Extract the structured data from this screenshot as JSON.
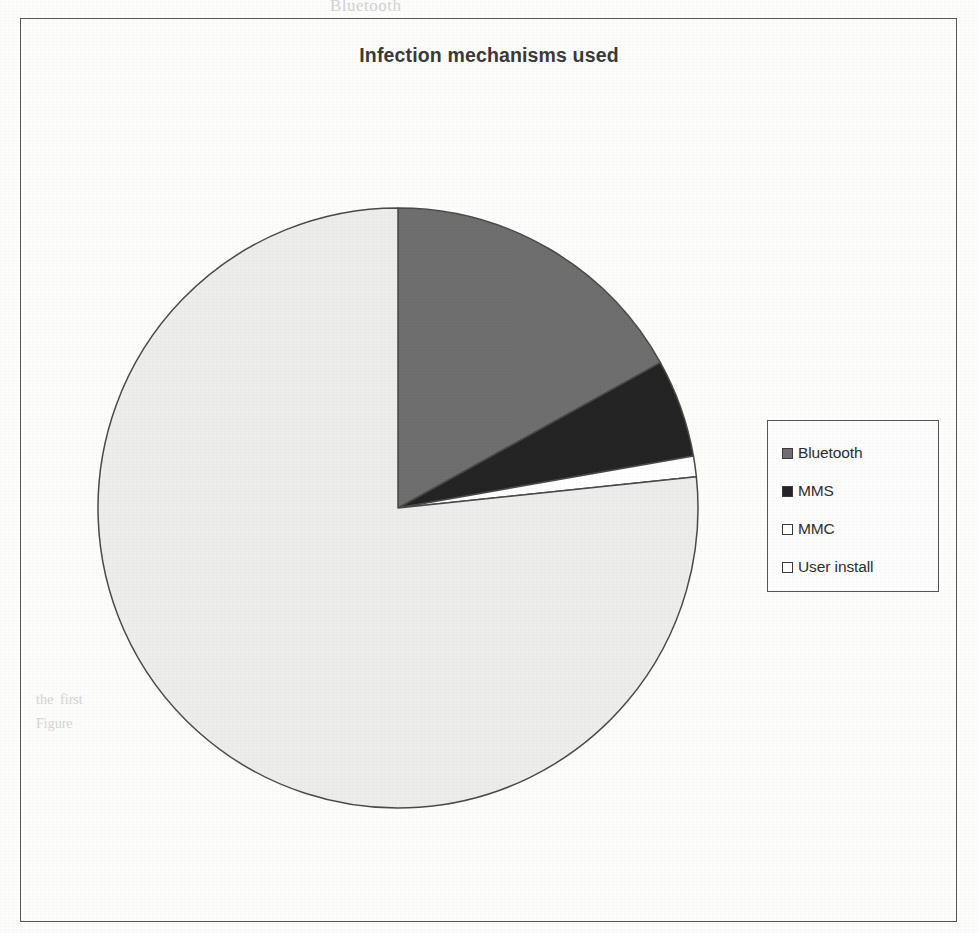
{
  "chart_data": {
    "type": "pie",
    "title": "Infection mechanisms used",
    "subtitle": "",
    "xlabel": "",
    "ylabel": "",
    "grid": false,
    "legend_position": "right",
    "start_angle_deg": 0,
    "direction": "clockwise",
    "categories": [
      "Bluetooth",
      "MMS",
      "MMC",
      "User install"
    ],
    "values": [
      17,
      5.3,
      1.1,
      76.6
    ],
    "value_unit": "percent",
    "angles_deg": [
      61,
      19,
      4,
      276
    ],
    "slice_colors": [
      "#6f6f6f",
      "#242424",
      "#ffffff",
      "#ededeb"
    ],
    "slices": [
      {
        "label": "Bluetooth",
        "value": 17,
        "angle_deg": 61,
        "color": "#6f6f6f",
        "swatch": "#6f6f6f"
      },
      {
        "label": "MMS",
        "value": 5.3,
        "angle_deg": 19,
        "color": "#242424",
        "swatch": "#242424"
      },
      {
        "label": "MMC",
        "value": 1.1,
        "angle_deg": 4,
        "color": "#ffffff",
        "swatch": "#ffffff"
      },
      {
        "label": "User install",
        "value": 76.6,
        "angle_deg": 276,
        "color": "#ededeb",
        "swatch": "#fcfcfc"
      }
    ]
  },
  "chart": {
    "title": "Infection mechanisms used",
    "frame_color": "#58585a",
    "outline_color": "#4a4a4a",
    "background": "#ffffff"
  },
  "legend": {
    "border_color": "#545456",
    "items": [
      {
        "label": "Bluetooth",
        "color": "#6f6f6f",
        "swatch_name": "legend-swatch-bluetooth"
      },
      {
        "label": "MMS",
        "color": "#242424",
        "swatch_name": "legend-swatch-mms"
      },
      {
        "label": "MMC",
        "color": "#ffffff",
        "swatch_name": "legend-swatch-mmc"
      },
      {
        "label": "User install",
        "color": "#fcfcfc",
        "swatch_name": "legend-swatch-user-install"
      }
    ]
  },
  "page_artifacts": {
    "ghost_top": "Bluetooth",
    "ghost_mid_a": "was a Mobile telecommunication Asso",
    "ghost_mid_b": "phone virus is [2]",
    "ghost_left_a": "the  first",
    "ghost_left_b": "Figure"
  }
}
